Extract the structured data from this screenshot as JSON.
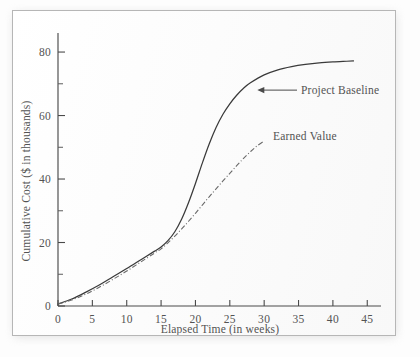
{
  "chart_data": {
    "type": "line",
    "title": "",
    "xlabel": "Elapsed Time (in weeks)",
    "ylabel": "Cumulative Cost ($ in thousands)",
    "xlim": [
      0,
      47
    ],
    "ylim": [
      0,
      86
    ],
    "grid": false,
    "legend_position": "inline-annotations",
    "xticks": [
      0,
      5,
      10,
      15,
      20,
      25,
      30,
      35,
      40,
      45
    ],
    "xtick_labels": [
      "0",
      "5",
      "10",
      "15",
      "20",
      "25",
      "30",
      "35",
      "40",
      "45"
    ],
    "yticks": [
      0,
      20,
      40,
      60,
      80
    ],
    "ytick_labels": [
      "0",
      "20",
      "40",
      "60",
      "80"
    ],
    "yticks_minor": [
      10,
      30,
      50,
      70
    ],
    "series": [
      {
        "name": "Project Baseline",
        "style": "solid",
        "color": "#3a3a3a",
        "x": [
          0,
          2,
          4,
          6,
          8,
          10,
          12,
          14,
          15,
          16,
          17,
          18,
          19,
          20,
          21,
          22,
          23,
          24,
          25,
          26,
          27,
          28,
          30,
          32,
          34,
          36,
          38,
          40,
          42,
          43
        ],
        "y": [
          0.6,
          2.2,
          4.3,
          6.6,
          9.2,
          11.8,
          14.5,
          17.2,
          18.6,
          20.6,
          23.4,
          27.4,
          32.6,
          38.6,
          45.0,
          51.0,
          56.2,
          60.4,
          63.7,
          66.4,
          68.6,
          70.3,
          72.8,
          74.4,
          75.4,
          76.1,
          76.6,
          76.9,
          77.1,
          77.2
        ]
      },
      {
        "name": "Earned Value",
        "style": "dash-dot",
        "color": "#6a6a6a",
        "x": [
          0,
          2,
          4,
          6,
          8,
          10,
          12,
          14,
          15,
          16,
          17,
          18,
          19,
          20,
          21,
          22,
          23,
          24,
          25,
          26,
          27,
          28,
          29,
          30
        ],
        "y": [
          0.6,
          1.9,
          3.7,
          5.9,
          8.4,
          11.0,
          13.8,
          16.6,
          18.0,
          19.9,
          22.0,
          24.3,
          26.7,
          29.2,
          31.8,
          34.4,
          36.9,
          39.4,
          41.8,
          44.2,
          46.5,
          48.6,
          50.5,
          52.0
        ]
      }
    ],
    "annotations": [
      {
        "label": "Project Baseline",
        "target_x": 29.0,
        "target_y": 68.0,
        "has_arrow": true
      },
      {
        "label": "Earned Value",
        "target_x": 31.0,
        "target_y": 53.5,
        "has_arrow": false
      }
    ]
  }
}
